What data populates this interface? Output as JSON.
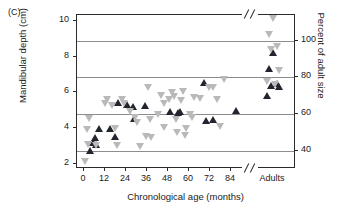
{
  "panel": {
    "label": "(C)"
  },
  "chart_data": {
    "type": "scatter",
    "title": "",
    "panel_label": "(C)",
    "xlabel": "Chronological age (months)",
    "ylabel": "Mandibular depth (cm)",
    "ylabel_right": "Percent of adult size",
    "grid": true,
    "grid_axis": "right",
    "legend": null,
    "axis_break_x": true,
    "axis_break_note": "x-axis broken between 90 months and the Adults category",
    "xlim": [
      -4,
      92
    ],
    "ylim": [
      1.7,
      10.35
    ],
    "ylim_right": [
      30,
      114
    ],
    "xticks": [
      0,
      12,
      24,
      36,
      48,
      60,
      72,
      84
    ],
    "xticklabels": [
      "0",
      "12",
      "24",
      "36",
      "48",
      "60",
      "72",
      "84"
    ],
    "x_category_label": "Adults",
    "yticks": [
      2,
      4,
      6,
      8,
      10
    ],
    "yticklabels": [
      "2",
      "4",
      "6",
      "8",
      "10"
    ],
    "yticks_right": [
      40,
      60,
      80,
      100
    ],
    "yticklabels_right": [
      "40",
      "60",
      "80",
      "100"
    ],
    "gridline_values_right": [
      40,
      60,
      80,
      100
    ],
    "gridline_values_left_cm": [
      3.0,
      4.55,
      6.05,
      7.5
    ],
    "colors": {
      "marker_dark": "#22242e",
      "marker_light": "#b9b9b9",
      "gridline": "#8d8d8d",
      "axis": "#2b2b2b",
      "text": "#1a1a1a",
      "background": "#ffffff"
    },
    "series": [
      {
        "name": "dark-up-triangle",
        "marker": "triangle-up",
        "color": "#22242e",
        "points": [
          [
            3.5,
            2.75
          ],
          [
            5.0,
            3.2
          ],
          [
            6.5,
            3.45
          ],
          [
            6.8,
            3.05
          ],
          [
            8.5,
            4.0
          ],
          [
            15.0,
            4.0
          ],
          [
            17.5,
            3.55
          ],
          [
            19.5,
            5.45
          ],
          [
            24.5,
            5.3
          ],
          [
            28.0,
            5.2
          ],
          [
            28.5,
            4.55
          ],
          [
            35.0,
            5.25
          ],
          [
            49.0,
            4.9
          ],
          [
            53.5,
            4.85
          ],
          [
            55.0,
            4.9
          ],
          [
            68.5,
            6.55
          ],
          [
            70.0,
            4.4
          ],
          [
            73.5,
            4.45
          ],
          [
            87.0,
            5.0
          ]
        ]
      },
      {
        "name": "light-down-triangle",
        "marker": "triangle-down",
        "color": "#b9b9b9",
        "points": [
          [
            0.5,
            2.1
          ],
          [
            1.5,
            3.9
          ],
          [
            2.5,
            3.1
          ],
          [
            3.0,
            4.55
          ],
          [
            7.0,
            3.0
          ],
          [
            12.0,
            5.35
          ],
          [
            13.0,
            5.6
          ],
          [
            16.0,
            5.25
          ],
          [
            18.0,
            4.0
          ],
          [
            19.0,
            3.0
          ],
          [
            21.5,
            5.6
          ],
          [
            23.0,
            5.35
          ],
          [
            26.5,
            4.9
          ],
          [
            29.0,
            4.6
          ],
          [
            30.5,
            4.3
          ],
          [
            32.0,
            2.95
          ],
          [
            35.5,
            3.5
          ],
          [
            36.5,
            6.25
          ],
          [
            38.0,
            4.45
          ],
          [
            38.5,
            3.45
          ],
          [
            42.5,
            4.75
          ],
          [
            44.0,
            5.8
          ],
          [
            45.5,
            5.35
          ],
          [
            46.0,
            4.05
          ],
          [
            48.5,
            5.6
          ],
          [
            50.5,
            6.0
          ],
          [
            51.5,
            5.75
          ],
          [
            52.5,
            4.5
          ],
          [
            53.0,
            3.75
          ],
          [
            55.5,
            5.55
          ],
          [
            56.5,
            6.05
          ],
          [
            57.5,
            3.6
          ],
          [
            58.5,
            4.0
          ],
          [
            60.5,
            4.75
          ],
          [
            61.5,
            4.6
          ],
          [
            63.0,
            5.7
          ],
          [
            66.5,
            5.65
          ],
          [
            71.5,
            6.3
          ],
          [
            74.0,
            6.25
          ],
          [
            76.0,
            5.6
          ],
          [
            78.0,
            4.1
          ],
          [
            80.0,
            6.75
          ]
        ]
      },
      {
        "name": "adults-dark-up-triangle",
        "marker": "triangle-up",
        "color": "#22242e",
        "category": "Adults",
        "points": [
          [
            null,
            8.25
          ],
          [
            null,
            7.35
          ],
          [
            null,
            6.5
          ],
          [
            null,
            6.4
          ],
          [
            null,
            6.35
          ],
          [
            null,
            5.85
          ]
        ]
      },
      {
        "name": "adults-light-down-triangle",
        "marker": "triangle-down",
        "color": "#b9b9b9",
        "category": "Adults",
        "points": [
          [
            null,
            10.15
          ],
          [
            null,
            9.25
          ],
          [
            null,
            8.55
          ],
          [
            null,
            8.4
          ],
          [
            null,
            7.25
          ],
          [
            null,
            6.6
          ],
          [
            null,
            6.45
          ]
        ]
      }
    ]
  }
}
